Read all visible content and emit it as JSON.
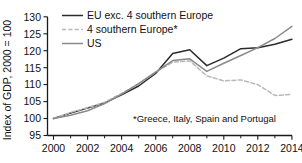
{
  "chart_data": {
    "type": "line",
    "title": "",
    "xlabel": "",
    "ylabel": "Index of GDP, 2000 = 100",
    "xlim": [
      2000,
      2014
    ],
    "ylim": [
      95,
      130
    ],
    "yticks": [
      95,
      100,
      105,
      110,
      115,
      120,
      125,
      130
    ],
    "xticks": [
      2000,
      2002,
      2004,
      2006,
      2008,
      2010,
      2012,
      2014
    ],
    "xticks_minor": [
      2001,
      2003,
      2005,
      2007,
      2009,
      2011,
      2013
    ],
    "grid": false,
    "legend_position": "top-center",
    "annotation": "*Greece, Italy, Spain and Portugal",
    "x": [
      2000,
      2001,
      2002,
      2003,
      2004,
      2005,
      2006,
      2007,
      2008,
      2009,
      2010,
      2011,
      2012,
      2013,
      2014
    ],
    "series": [
      {
        "name": "EU exc. 4 southern Europe",
        "color": "#2b2b2b",
        "style": "solid",
        "width": 1.5,
        "values": [
          100.0,
          101.6,
          103.1,
          104.6,
          107.0,
          109.6,
          113.3,
          119.2,
          120.3,
          115.6,
          117.8,
          120.6,
          120.9,
          121.9,
          123.4
        ]
      },
      {
        "name": "4 southern Europe*",
        "color": "#b9b9b9",
        "style": "dashed",
        "width": 1.5,
        "values": [
          100.0,
          101.8,
          103.2,
          104.8,
          107.4,
          110.2,
          113.7,
          116.6,
          117.0,
          112.6,
          111.1,
          111.4,
          110.0,
          106.8,
          107.1
        ]
      },
      {
        "name": "US",
        "color": "#8a8a8a",
        "style": "solid",
        "width": 1.5,
        "values": [
          100.0,
          101.0,
          102.3,
          104.4,
          107.2,
          110.3,
          113.7,
          117.1,
          117.6,
          113.9,
          116.3,
          118.6,
          120.9,
          123.6,
          127.2
        ]
      }
    ]
  },
  "axes": {
    "ylabel": "Index of GDP, 2000 = 100",
    "ytick_labels": [
      "130",
      "125",
      "120",
      "115",
      "110",
      "105",
      "100",
      "95"
    ],
    "xtick_labels": [
      "2000",
      "2002",
      "2004",
      "2006",
      "2008",
      "2010",
      "2012",
      "2014"
    ]
  },
  "legend": {
    "items": [
      {
        "label": "EU exc. 4 southern Europe"
      },
      {
        "label": "4 southern Europe*"
      },
      {
        "label": "US"
      }
    ]
  },
  "annotation": {
    "footnote": "*Greece, Italy, Spain and Portugal"
  }
}
